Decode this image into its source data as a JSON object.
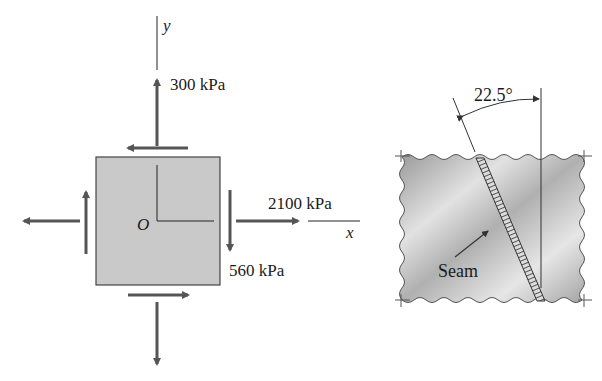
{
  "figure_left": {
    "title": "Plane stress element",
    "origin_label": "O",
    "x_axis_label": "x",
    "y_axis_label": "y",
    "sigma_y_label": "300 kPa",
    "sigma_x_label": "2100 kPa",
    "tau_label": "560 kPa",
    "element_fill": "#c9c9c9",
    "arrow_color": "#555555"
  },
  "figure_right": {
    "title": "Welded plate with seam",
    "angle_label": "22.5°",
    "seam_label": "Seam",
    "plate_color_light": "#e6e6e6",
    "plate_color_dark": "#9a9a9a"
  }
}
